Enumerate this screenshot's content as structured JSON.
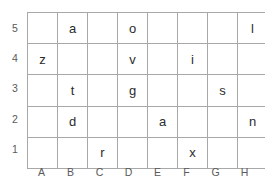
{
  "figure": {
    "type": "letter-grid",
    "columns": [
      "A",
      "B",
      "C",
      "D",
      "E",
      "F",
      "G",
      "H"
    ],
    "rows": [
      "5",
      "4",
      "3",
      "2",
      "1"
    ],
    "grid_line_color": "#a8a8a8",
    "letter_color": "#2b2b2b",
    "label_color": "#5a5a5a",
    "background_color": "#ffffff"
  },
  "grid": {
    "row_labels": [
      "5",
      "4",
      "3",
      "2",
      "1"
    ],
    "column_labels": [
      "A",
      "B",
      "C",
      "D",
      "E",
      "F",
      "G",
      "H"
    ],
    "cells": [
      [
        "",
        "a",
        "",
        "o",
        "",
        "",
        "",
        "l"
      ],
      [
        "z",
        "",
        "",
        "v",
        "",
        "i",
        "",
        ""
      ],
      [
        "",
        "t",
        "",
        "g",
        "",
        "",
        "s",
        ""
      ],
      [
        "",
        "d",
        "",
        "",
        "a",
        "",
        "",
        "n"
      ],
      [
        "",
        "",
        "r",
        "",
        "",
        "x",
        "",
        ""
      ]
    ],
    "filled": [
      {
        "column": "B",
        "row": "5",
        "letter": "a"
      },
      {
        "column": "D",
        "row": "5",
        "letter": "o"
      },
      {
        "column": "H",
        "row": "5",
        "letter": "l"
      },
      {
        "column": "A",
        "row": "4",
        "letter": "z"
      },
      {
        "column": "D",
        "row": "4",
        "letter": "v"
      },
      {
        "column": "F",
        "row": "4",
        "letter": "i"
      },
      {
        "column": "B",
        "row": "3",
        "letter": "t"
      },
      {
        "column": "D",
        "row": "3",
        "letter": "g"
      },
      {
        "column": "G",
        "row": "3",
        "letter": "s"
      },
      {
        "column": "B",
        "row": "2",
        "letter": "d"
      },
      {
        "column": "E",
        "row": "2",
        "letter": "a"
      },
      {
        "column": "H",
        "row": "2",
        "letter": "n"
      },
      {
        "column": "C",
        "row": "1",
        "letter": "r"
      },
      {
        "column": "F",
        "row": "1",
        "letter": "x"
      }
    ]
  }
}
